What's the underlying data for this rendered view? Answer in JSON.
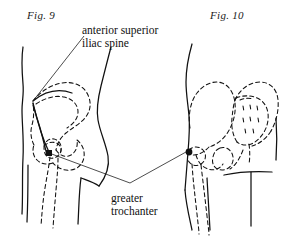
{
  "plate": {
    "width": 281,
    "height": 238,
    "background": "#ffffff",
    "ink": "#111111"
  },
  "figures": [
    {
      "id": "fig-9",
      "caption": "Fig. 9",
      "view": "lateral hip, left side",
      "marker": {
        "type": "square",
        "x": 49,
        "y": 153
      }
    },
    {
      "id": "fig-10",
      "caption": "Fig. 10",
      "view": "posterior pelvis",
      "marker": {
        "type": "dot",
        "x": 189,
        "y": 152
      }
    }
  ],
  "annotations": {
    "asis": {
      "line1": "anterior superior",
      "line2": "iliac spine",
      "target_x": 33,
      "target_y": 100
    },
    "greater_trochanter": {
      "line1": "greater",
      "line2": "trochanter",
      "vertex_x": 130,
      "vertex_y": 183
    }
  }
}
